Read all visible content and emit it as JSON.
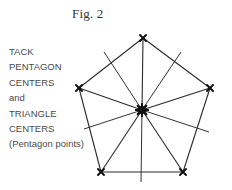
{
  "figure": {
    "title": "Fig. 2"
  },
  "caption": {
    "lines": [
      "TACK",
      "PENTAGON",
      "CENTERS",
      "and",
      "TRIANGLE",
      "CENTERS",
      "(Pentagon points)"
    ]
  },
  "diagram": {
    "shape": "pentagon",
    "center": [
      142,
      110
    ],
    "vertices": [
      [
        143,
        38
      ],
      [
        210,
        88
      ],
      [
        183,
        172
      ],
      [
        101,
        172
      ],
      [
        79,
        88
      ]
    ],
    "apothem_ends": [
      [
        181,
        52
      ],
      [
        209,
        132
      ],
      [
        141,
        182
      ],
      [
        84,
        129
      ],
      [
        104,
        52
      ]
    ],
    "colors": {
      "line": "#2a2a2a",
      "tack": "#111111",
      "text": "#4a4a4a"
    }
  }
}
